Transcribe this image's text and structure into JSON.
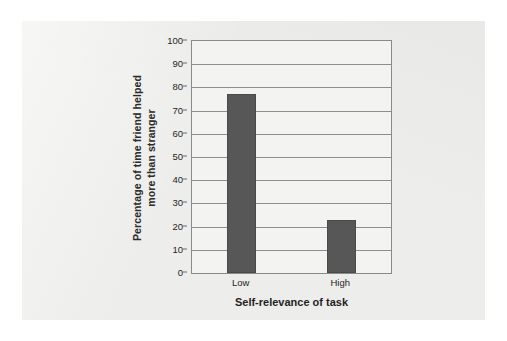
{
  "chart_data": {
    "type": "bar",
    "title": "",
    "subtitle": "",
    "categories": [
      "Low",
      "High"
    ],
    "values": [
      77,
      23
    ],
    "series": [
      {
        "name": "Percentage of time friend helped more than stranger",
        "values": [
          77,
          23
        ]
      }
    ],
    "xlabel": "Self-relevance of task",
    "ylabel": "Percentage of time friend helped more than stranger",
    "ylabel_line1": "Percentage of time friend helped",
    "ylabel_line2": "more than stranger",
    "ylim": [
      0,
      100
    ],
    "ytick_step": 10,
    "yticks": [
      0,
      10,
      20,
      30,
      40,
      50,
      60,
      70,
      80,
      90,
      100
    ],
    "ytick_labels": [
      "0",
      "10",
      "20",
      "30",
      "40",
      "50",
      "60",
      "70",
      "80",
      "90",
      "100"
    ],
    "grid": true,
    "grid_axis": "y",
    "legend": false,
    "legend_position": "none",
    "annotations": [],
    "colors": {
      "bar_fill": "#575757",
      "bar_edge": "#4a4a4a",
      "plot_background": "#f3f3f1",
      "page_background": "#ededeb",
      "outer_background": "#ffffff",
      "gridline": "#8e8e8e",
      "axis_frame": "#8a8a8a",
      "text": "#1f1f1f"
    }
  }
}
